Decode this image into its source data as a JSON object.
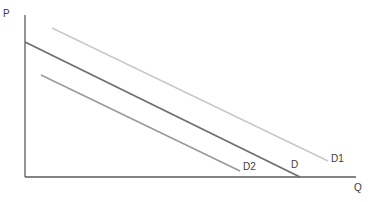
{
  "diagram": {
    "type": "supply-demand",
    "title": "",
    "axes": {
      "y_label": "P",
      "x_label": "Q",
      "origin": [
        25,
        177
      ],
      "y_top": 15,
      "x_right": 356,
      "color": "#5a5a5a"
    },
    "curves": [
      {
        "name": "D1",
        "label": "D1",
        "x1": 52,
        "y1": 28,
        "x2": 328,
        "y2": 161,
        "color": "#c8c8c8",
        "label_x": 331,
        "label_y": 162
      },
      {
        "name": "D",
        "label": "D",
        "x1": 25,
        "y1": 42,
        "x2": 300,
        "y2": 177,
        "color": "#6e6e6e",
        "label_x": 291,
        "label_y": 168
      },
      {
        "name": "D2",
        "label": "D2",
        "x1": 41,
        "y1": 75,
        "x2": 240,
        "y2": 171,
        "color": "#9a9a9a",
        "label_x": 243,
        "label_y": 170
      }
    ]
  }
}
